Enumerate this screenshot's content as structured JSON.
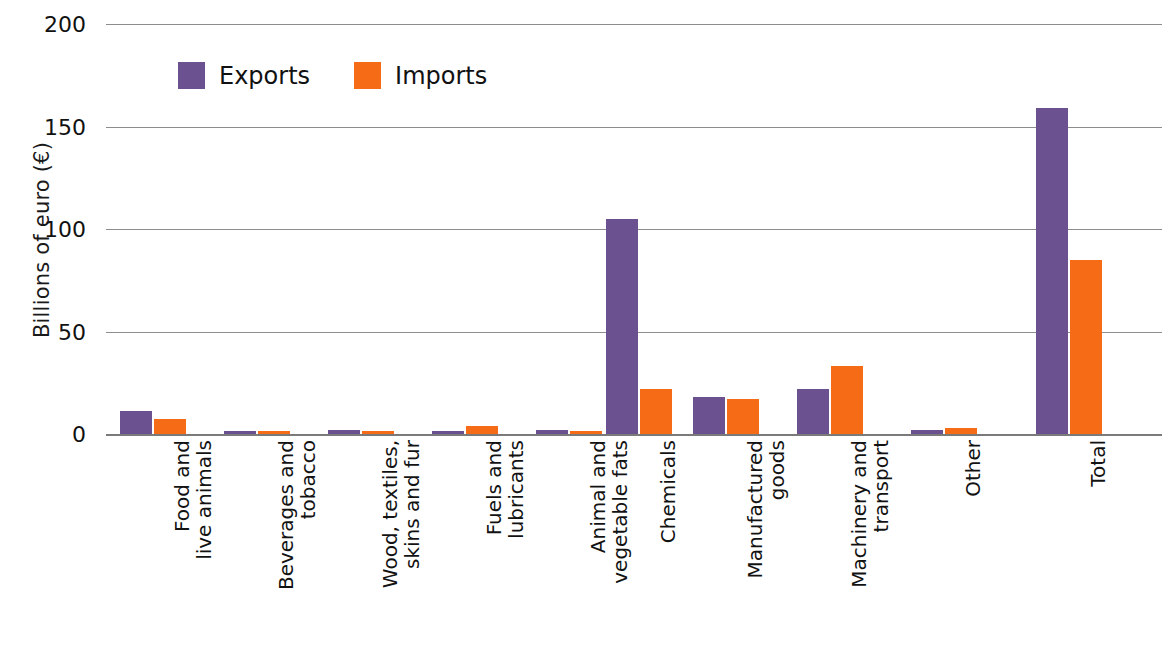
{
  "chart_data": {
    "type": "bar",
    "title": "",
    "xlabel": "",
    "ylabel": "Billions of euro (€)",
    "ylim": [
      0,
      200
    ],
    "yticks": [
      0,
      50,
      100,
      150,
      200
    ],
    "ytick_labels": [
      "0",
      "50",
      "100",
      "150",
      "200"
    ],
    "grid": true,
    "legend_position": "top-left-inside",
    "categories": [
      "Food and\nlive animals",
      "Beverages and\ntobacco",
      "Wood, textiles,\nskins and fur",
      "Fuels and\nlubricants",
      "Animal and\nvegetable fats",
      "Chemicals",
      "Manufactured\ngoods",
      "Machinery and\ntransport",
      "Other",
      "Total"
    ],
    "series": [
      {
        "name": "Exports",
        "color": "#6c5190",
        "values": [
          11,
          1.5,
          2,
          1.5,
          2,
          105,
          18,
          22,
          2,
          159
        ]
      },
      {
        "name": "Imports",
        "color": "#f66c16",
        "values": [
          7.5,
          1.5,
          1.5,
          4,
          1.5,
          22,
          17,
          33,
          3,
          85
        ]
      }
    ]
  },
  "legend": {
    "items": [
      {
        "label": "Exports",
        "color": "#6c5190"
      },
      {
        "label": "Imports",
        "color": "#f66c16"
      }
    ]
  },
  "axes": {
    "y_title": "Billions of euro (€)"
  }
}
